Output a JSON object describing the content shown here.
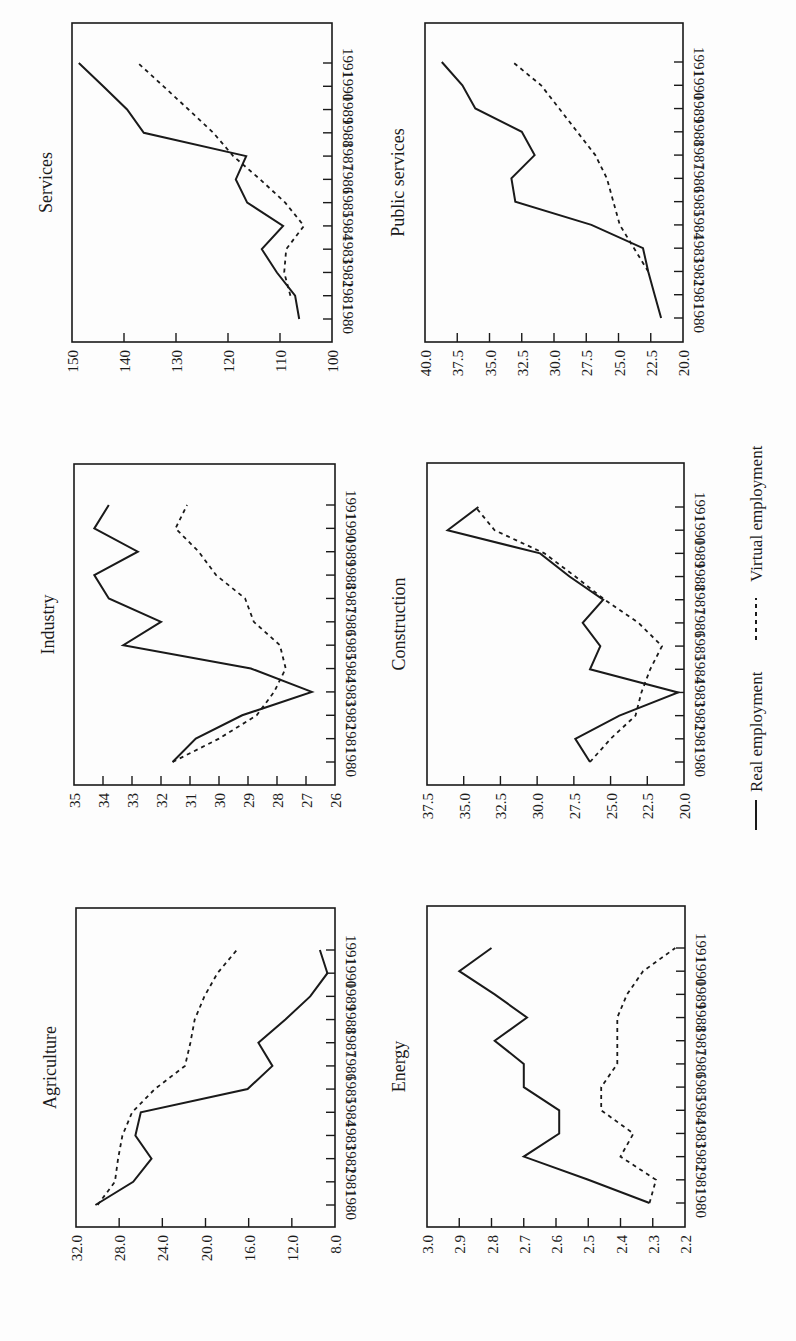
{
  "figure": {
    "legend": {
      "real_label": "Real employment",
      "virtual_label": "Virtual employment"
    }
  },
  "chart_data": [
    {
      "type": "line",
      "title": "Services",
      "position": "top-left",
      "x": [
        1980,
        1981,
        1982,
        1983,
        1984,
        1985,
        1986,
        1987,
        1988,
        1989,
        1990,
        1991
      ],
      "yticks": [
        "150",
        "140",
        "130",
        "120",
        "110",
        "100"
      ],
      "ylim": [
        100,
        150
      ],
      "grid": false,
      "series": [
        {
          "name": "Real employment",
          "style": "solid",
          "values": [
            106.3,
            107.1,
            110.6,
            113.5,
            109.4,
            116.3,
            118.5,
            116.5,
            136.2,
            139.4,
            144.0,
            148.7
          ]
        },
        {
          "name": "Virtual employment",
          "style": "dashed",
          "values": [
            null,
            108.0,
            109.2,
            108.8,
            105.4,
            109.0,
            113.8,
            119.0,
            122.8,
            127.6,
            132.4,
            137.3
          ]
        }
      ]
    },
    {
      "type": "line",
      "title": "Public services",
      "position": "top-right",
      "x": [
        1980,
        1981,
        1982,
        1983,
        1984,
        1985,
        1986,
        1987,
        1988,
        1989,
        1990,
        1991
      ],
      "yticks": [
        "40.0",
        "37.5",
        "35.0",
        "32.5",
        "30.0",
        "27.5",
        "25.0",
        "22.5",
        "20.0"
      ],
      "ylim": [
        20,
        40
      ],
      "grid": false,
      "series": [
        {
          "name": "Real employment",
          "style": "solid",
          "values": [
            21.7,
            22.2,
            22.7,
            23.1,
            27.1,
            33.0,
            33.3,
            31.5,
            32.5,
            36.1,
            37.1,
            38.7
          ]
        },
        {
          "name": "Virtual employment",
          "style": "dashed",
          "values": [
            null,
            null,
            22.7,
            23.8,
            24.9,
            25.4,
            25.9,
            26.8,
            28.2,
            29.6,
            31.0,
            33.2
          ]
        }
      ]
    },
    {
      "type": "line",
      "title": "Industry",
      "position": "middle-left",
      "x": [
        1980,
        1981,
        1982,
        1983,
        1984,
        1985,
        1986,
        1987,
        1988,
        1989,
        1990,
        1991
      ],
      "yticks": [
        "35",
        "34",
        "33",
        "32",
        "31",
        "30",
        "29",
        "28",
        "27",
        "26"
      ],
      "ylim": [
        26,
        35
      ],
      "grid": false,
      "series": [
        {
          "name": "Real employment",
          "style": "solid",
          "values": [
            31.6,
            30.8,
            29.2,
            26.8,
            28.9,
            33.3,
            32.0,
            33.8,
            34.3,
            32.8,
            34.3,
            33.8
          ]
        },
        {
          "name": "Virtual employment",
          "style": "dashed",
          "values": [
            31.6,
            30.0,
            28.7,
            28.1,
            27.7,
            27.9,
            28.8,
            29.1,
            30.1,
            30.7,
            31.5,
            31.1
          ]
        }
      ]
    },
    {
      "type": "line",
      "title": "Construction",
      "position": "middle-right",
      "x": [
        1980,
        1981,
        1982,
        1983,
        1984,
        1985,
        1986,
        1987,
        1988,
        1989,
        1990,
        1991
      ],
      "yticks": [
        "37.5",
        "35.0",
        "32.5",
        "30.0",
        "27.5",
        "25.0",
        "22.5",
        "20.0"
      ],
      "ylim": [
        20,
        37.5
      ],
      "grid": false,
      "series": [
        {
          "name": "Real employment",
          "style": "solid",
          "values": [
            26.4,
            27.4,
            24.4,
            20.4,
            26.4,
            25.7,
            26.9,
            25.5,
            27.8,
            29.8,
            36.1,
            34.0
          ]
        },
        {
          "name": "Virtual employment",
          "style": "dashed",
          "values": [
            26.4,
            25.0,
            23.3,
            22.9,
            22.3,
            21.5,
            23.1,
            25.4,
            27.4,
            29.5,
            32.9,
            34.2
          ]
        }
      ]
    },
    {
      "type": "line",
      "title": "Agriculture",
      "position": "bottom-left",
      "x": [
        1980,
        1981,
        1982,
        1983,
        1984,
        1985,
        1986,
        1987,
        1988,
        1989,
        1990,
        1991
      ],
      "yticks": [
        "32.0",
        "28.0",
        "24.0",
        "20.0",
        "16.0",
        "12.0",
        "8.0"
      ],
      "ylim": [
        8,
        32
      ],
      "grid": false,
      "series": [
        {
          "name": "Real employment",
          "style": "solid",
          "values": [
            30.2,
            26.7,
            25.0,
            26.5,
            26.0,
            16.1,
            13.8,
            15.1,
            12.6,
            10.3,
            8.7,
            9.4
          ]
        },
        {
          "name": "Virtual employment",
          "style": "dashed",
          "values": [
            30.0,
            28.4,
            28.1,
            27.7,
            26.8,
            24.7,
            21.9,
            21.4,
            21.0,
            20.1,
            18.9,
            17.1
          ]
        }
      ]
    },
    {
      "type": "line",
      "title": "Energy",
      "position": "bottom-right",
      "x": [
        1980,
        1981,
        1982,
        1983,
        1984,
        1985,
        1986,
        1987,
        1988,
        1989,
        1990,
        1991
      ],
      "yticks": [
        "3.0",
        "2.9",
        "2.8",
        "2.7",
        "2.6",
        "2.5",
        "2.4",
        "2.3",
        "2.2"
      ],
      "ylim": [
        2.2,
        3.0
      ],
      "grid": false,
      "series": [
        {
          "name": "Real employment",
          "style": "solid",
          "values": [
            2.31,
            2.5,
            2.7,
            2.59,
            2.59,
            2.7,
            2.7,
            2.79,
            2.69,
            2.79,
            2.9,
            2.8
          ]
        },
        {
          "name": "Virtual employment",
          "style": "dashed",
          "values": [
            2.31,
            2.29,
            2.4,
            2.36,
            2.46,
            2.46,
            2.41,
            2.41,
            2.41,
            2.38,
            2.33,
            2.23
          ]
        }
      ]
    }
  ]
}
